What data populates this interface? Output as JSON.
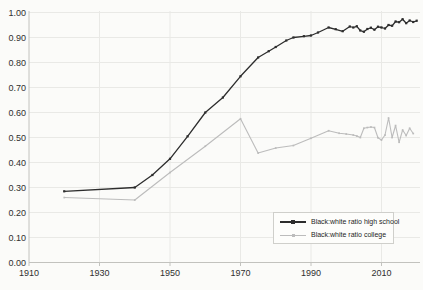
{
  "chart_data": {
    "type": "line",
    "title": "",
    "xlabel": "",
    "ylabel": "",
    "grid": true,
    "legend_position": "lower-right",
    "xlim": [
      1910,
      2021
    ],
    "ylim": [
      0.0,
      1.0
    ],
    "x_ticks": [
      1910,
      1930,
      1950,
      1970,
      1990,
      2010
    ],
    "y_tick_labels": [
      "0.00",
      "0.10",
      "0.20",
      "0.30",
      "0.40",
      "0.50",
      "0.60",
      "0.70",
      "0.80",
      "0.90",
      "1.00"
    ],
    "colors": {
      "high_school_line": "#2d2d2d",
      "college_line": "#bcbcbc",
      "gridline": "#e9e9e6",
      "spine": "#c2c2be",
      "tick_text": "#2f2f2f"
    },
    "series": [
      {
        "name": "Black:white ratio high school",
        "color": "#2d2d2d",
        "marker": "square",
        "marker_size": 2.2,
        "line_width": 1.3,
        "points": [
          [
            1920,
            0.285
          ],
          [
            1940,
            0.3
          ],
          [
            1945,
            0.35
          ],
          [
            1950,
            0.415
          ],
          [
            1955,
            0.505
          ],
          [
            1960,
            0.6
          ],
          [
            1965,
            0.66
          ],
          [
            1970,
            0.745
          ],
          [
            1975,
            0.82
          ],
          [
            1978,
            0.845
          ],
          [
            1980,
            0.862
          ],
          [
            1983,
            0.888
          ],
          [
            1985,
            0.9
          ],
          [
            1988,
            0.905
          ],
          [
            1990,
            0.908
          ],
          [
            1992,
            0.92
          ],
          [
            1995,
            0.94
          ],
          [
            1997,
            0.933
          ],
          [
            1999,
            0.925
          ],
          [
            2001,
            0.944
          ],
          [
            2002,
            0.94
          ],
          [
            2003,
            0.945
          ],
          [
            2004,
            0.928
          ],
          [
            2005,
            0.923
          ],
          [
            2006,
            0.934
          ],
          [
            2007,
            0.939
          ],
          [
            2008,
            0.931
          ],
          [
            2009,
            0.943
          ],
          [
            2010,
            0.94
          ],
          [
            2011,
            0.936
          ],
          [
            2012,
            0.95
          ],
          [
            2013,
            0.947
          ],
          [
            2014,
            0.964
          ],
          [
            2015,
            0.961
          ],
          [
            2016,
            0.973
          ],
          [
            2017,
            0.957
          ],
          [
            2018,
            0.968
          ],
          [
            2019,
            0.962
          ],
          [
            2020,
            0.967
          ]
        ]
      },
      {
        "name": "Black:white ratio college",
        "color": "#bcbcbc",
        "marker": "square",
        "marker_size": 1.7,
        "line_width": 1.1,
        "points": [
          [
            1920,
            0.26
          ],
          [
            1940,
            0.25
          ],
          [
            1950,
            0.36
          ],
          [
            1960,
            0.465
          ],
          [
            1970,
            0.575
          ],
          [
            1975,
            0.438
          ],
          [
            1980,
            0.458
          ],
          [
            1985,
            0.468
          ],
          [
            1990,
            0.497
          ],
          [
            1995,
            0.527
          ],
          [
            1998,
            0.517
          ],
          [
            2000,
            0.514
          ],
          [
            2002,
            0.51
          ],
          [
            2003,
            0.506
          ],
          [
            2004,
            0.5
          ],
          [
            2005,
            0.537
          ],
          [
            2006,
            0.54
          ],
          [
            2007,
            0.542
          ],
          [
            2008,
            0.54
          ],
          [
            2009,
            0.499
          ],
          [
            2010,
            0.49
          ],
          [
            2011,
            0.51
          ],
          [
            2012,
            0.578
          ],
          [
            2013,
            0.5
          ],
          [
            2014,
            0.548
          ],
          [
            2015,
            0.481
          ],
          [
            2016,
            0.53
          ],
          [
            2017,
            0.508
          ],
          [
            2018,
            0.537
          ],
          [
            2019,
            0.516
          ]
        ]
      }
    ]
  },
  "legend": {
    "items": [
      {
        "label": "Black:white ratio high school"
      },
      {
        "label": "Black:white ratio college"
      }
    ]
  }
}
